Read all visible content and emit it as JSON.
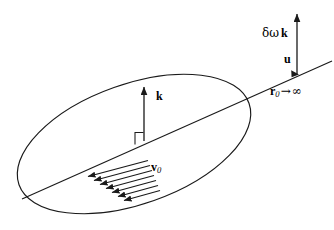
{
  "figure": {
    "title": "",
    "background_color": "#ffffff",
    "stroke_color": "#1a1a1a",
    "labels": {
      "domega_k": {
        "greek_delta": "δ",
        "greek_omega": "ω",
        "vector": "k"
      },
      "u": {
        "vector": "u"
      },
      "r0_infinity": {
        "vector": "r",
        "subscript": "0",
        "arrow": "→",
        "limit": "∞"
      },
      "k": {
        "vector": "k"
      },
      "v0": {
        "vector": "v",
        "subscript": "0"
      }
    },
    "elements": {
      "plane": "tilted-ellipse",
      "axis_line": "ray-through-plane",
      "normal_vector": "k",
      "right_angle_marker": "square",
      "velocity_field": "parallel-arrow-bundle",
      "perturbation_vector": "delta-omega-k",
      "flow_vector": "u"
    },
    "velocity_arrow_count": 7
  }
}
